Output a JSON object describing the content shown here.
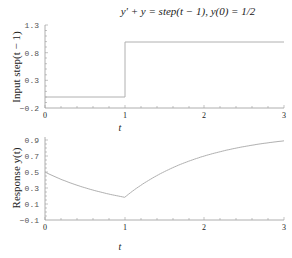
{
  "title": "y' + y = step(t − 1),    y(0) = 1/2",
  "chart_data": [
    {
      "type": "line",
      "title": "y' + y = step(t − 1),    y(0) = 1/2",
      "xlabel": "t",
      "ylabel": "Input step(t − 1)",
      "xlim": [
        0,
        3
      ],
      "ylim": [
        -0.2,
        1.3
      ],
      "xticks": [
        "0",
        "1",
        "2",
        "3"
      ],
      "yticks": [
        "-0.2",
        "0.3",
        "0.8",
        "1.3"
      ],
      "grid": false,
      "series": [
        {
          "name": "step(t-1)",
          "x": [
            0,
            1,
            1,
            3
          ],
          "y": [
            0,
            0,
            1,
            1
          ]
        }
      ]
    },
    {
      "type": "line",
      "title": "",
      "xlabel": "t",
      "ylabel": "Response y(t)",
      "xlim": [
        0,
        3
      ],
      "ylim": [
        -0.1,
        0.9
      ],
      "xticks": [
        "0",
        "1",
        "2",
        "3"
      ],
      "yticks": [
        "-0.1",
        "0.1",
        "0.3",
        "0.5",
        "0.7",
        "0.9"
      ],
      "grid": false,
      "series": [
        {
          "name": "y(t)",
          "x": [
            0,
            0.25,
            0.5,
            0.75,
            1,
            1.25,
            1.5,
            1.75,
            2,
            2.25,
            2.5,
            2.75,
            3
          ],
          "y": [
            0.5,
            0.389,
            0.303,
            0.236,
            0.184,
            0.364,
            0.505,
            0.615,
            0.7,
            0.766,
            0.818,
            0.858,
            0.89
          ]
        }
      ]
    }
  ],
  "top_plot": {
    "ylabel": "Input step(t − 1)",
    "xlabel": "t",
    "yticks": [
      "1.3",
      "0.8",
      "0.3",
      "−0.2"
    ],
    "xticks": [
      "0",
      "1",
      "2",
      "3"
    ]
  },
  "bottom_plot": {
    "ylabel": "Response y(t)",
    "xlabel": "t",
    "yticks": [
      "0.9",
      "0.7",
      "0.5",
      "0.3",
      "0.1",
      "−0.1"
    ],
    "xticks": [
      "0",
      "1",
      "2",
      "3"
    ]
  },
  "colors": {
    "line": "#b0b0b0",
    "axis": "#9a9a9a"
  }
}
